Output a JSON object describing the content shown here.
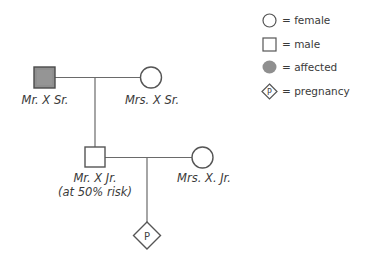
{
  "pedigree": {
    "generation1": {
      "father": {
        "label": "Mr. X Sr.",
        "sex": "male",
        "affected": true
      },
      "mother": {
        "label": "Mrs. X Sr.",
        "sex": "female",
        "affected": false
      }
    },
    "generation2": {
      "son": {
        "label": "Mr. X Jr.",
        "sublabel": "(at 50% risk)",
        "sex": "male",
        "affected": false
      },
      "spouse": {
        "label": "Mrs. X. Jr.",
        "sex": "female",
        "affected": false
      }
    },
    "generation3": {
      "pregnancy": {
        "symbol_text": "P",
        "type": "pregnancy"
      }
    }
  },
  "legend": {
    "items": [
      {
        "symbol": "circle-icon",
        "label": "= female"
      },
      {
        "symbol": "square-icon",
        "label": "= male"
      },
      {
        "symbol": "affected-blob-icon",
        "label": "= affected"
      },
      {
        "symbol": "pregnancy-diamond-icon",
        "symbol_text": "P",
        "label": "= pregnancy"
      }
    ]
  },
  "colors": {
    "line": "#555555",
    "affected_fill": "#8c8c8c",
    "background": "#ffffff"
  }
}
